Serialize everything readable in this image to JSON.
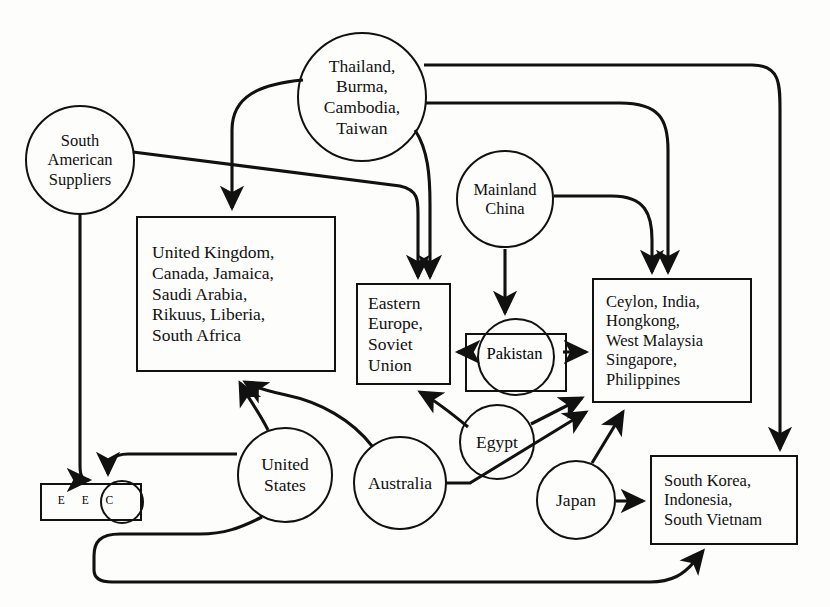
{
  "diagram": {
    "style": {
      "stroke": "#111111",
      "background": "#fdfdfb"
    },
    "nodes": [
      {
        "id": "thailand",
        "shape": "circle",
        "label": "Thailand,\nBurma,\nCambodia,\nTaiwan"
      },
      {
        "id": "south_american_suppliers",
        "shape": "circle",
        "label": "South\nAmerican\nSuppliers"
      },
      {
        "id": "mainland_china",
        "shape": "circle",
        "label": "Mainland\nChina"
      },
      {
        "id": "uk_group",
        "shape": "rect",
        "label": "United Kingdom,\nCanada, Jamaica,\nSaudi Arabia,\nRikuus, Liberia,\nSouth Africa"
      },
      {
        "id": "eastern_europe",
        "shape": "rect",
        "label": "Eastern\nEurope,\nSoviet\nUnion"
      },
      {
        "id": "ceylon_group",
        "shape": "rect",
        "label": "Ceylon, India,\nHongkong,\nWest Malaysia\nSingapore,\nPhilippines"
      },
      {
        "id": "pakistan",
        "shape": "circle-in-rect",
        "label": "Pakistan"
      },
      {
        "id": "eec",
        "shape": "rect-with-circle",
        "label": "E  E  C",
        "letters": [
          "E",
          "E",
          "C"
        ]
      },
      {
        "id": "united_states",
        "shape": "circle",
        "label": "United\nStates"
      },
      {
        "id": "australia",
        "shape": "circle",
        "label": "Australia"
      },
      {
        "id": "egypt",
        "shape": "circle",
        "label": "Egypt"
      },
      {
        "id": "japan",
        "shape": "circle",
        "label": "Japan"
      },
      {
        "id": "south_korea_group",
        "shape": "rect",
        "label": "South Korea,\nIndonesia,\nSouth Vietnam"
      }
    ],
    "edges": [
      {
        "from": "thailand",
        "to": "uk_group"
      },
      {
        "from": "thailand",
        "to": "eastern_europe"
      },
      {
        "from": "thailand",
        "to": "ceylon_group"
      },
      {
        "from": "thailand",
        "to": "south_korea_group"
      },
      {
        "from": "south_american_suppliers",
        "to": "eastern_europe"
      },
      {
        "from": "south_american_suppliers",
        "to": "eec"
      },
      {
        "from": "mainland_china",
        "to": "pakistan"
      },
      {
        "from": "mainland_china",
        "to": "ceylon_group"
      },
      {
        "from": "pakistan",
        "to": "eastern_europe"
      },
      {
        "from": "pakistan",
        "to": "ceylon_group"
      },
      {
        "from": "united_states",
        "to": "uk_group"
      },
      {
        "from": "united_states",
        "to": "eec"
      },
      {
        "from": "united_states",
        "to": "south_korea_group"
      },
      {
        "from": "australia",
        "to": "eastern_europe"
      },
      {
        "from": "australia",
        "to": "ceylon_group"
      },
      {
        "from": "egypt",
        "to": "eastern_europe"
      },
      {
        "from": "egypt",
        "to": "ceylon_group"
      },
      {
        "from": "japan",
        "to": "ceylon_group"
      },
      {
        "from": "japan",
        "to": "south_korea_group"
      }
    ]
  }
}
